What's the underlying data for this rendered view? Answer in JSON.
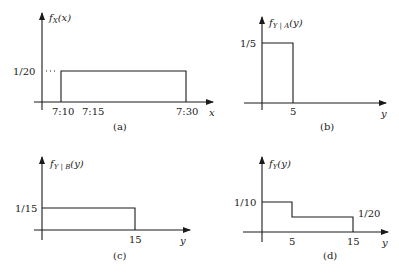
{
  "panels": {
    "a": {
      "caption": "(a)",
      "ylabel": {
        "f": "f",
        "sub": "X",
        "arg": "(x)"
      },
      "xlabel": "x",
      "y_tick": "1/20",
      "x_ticks": [
        "7:10",
        "7:15",
        "7:30"
      ]
    },
    "b": {
      "caption": "(b)",
      "ylabel": {
        "f": "f",
        "sub": "Y | A",
        "arg": "(y)"
      },
      "xlabel": "y",
      "y_tick": "1/5",
      "x_ticks": [
        "5"
      ]
    },
    "c": {
      "caption": "(c)",
      "ylabel": {
        "f": "f",
        "sub": "Y | B",
        "arg": "(y)"
      },
      "xlabel": "y",
      "y_tick": "1/15",
      "x_ticks": [
        "15"
      ]
    },
    "d": {
      "caption": "(d)",
      "ylabel": {
        "f": "f",
        "sub": "Y",
        "arg": "(y)"
      },
      "xlabel": "y",
      "y_ticks": [
        "1/10",
        "1/20"
      ],
      "x_ticks": [
        "5",
        "15"
      ]
    }
  }
}
